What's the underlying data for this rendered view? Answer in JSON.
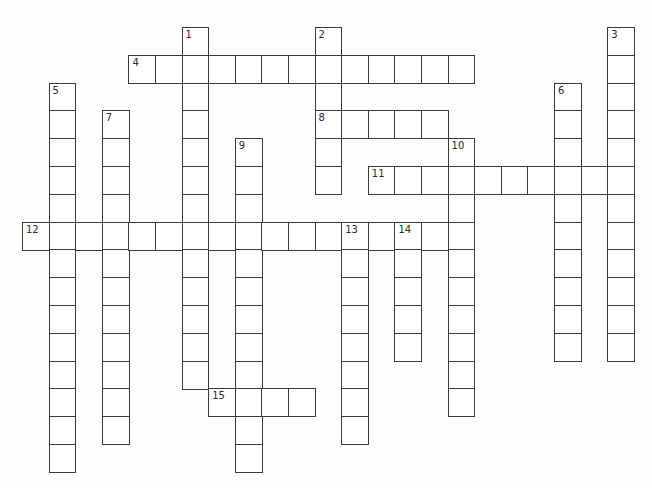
{
  "puzzle": {
    "layout": {
      "origin_x": 22,
      "origin_y": 27,
      "cell_w": 26.6,
      "cell_h": 27.8
    },
    "colors": {
      "border": "#3a3a3a",
      "cell_fill": "#ffffff",
      "background": "#fdfdfc"
    },
    "entries": [
      {
        "number": "1",
        "direction": "down",
        "row": 0,
        "col": 6,
        "length": 13
      },
      {
        "number": "2",
        "direction": "down",
        "row": 0,
        "col": 11,
        "length": 6
      },
      {
        "number": "3",
        "direction": "down",
        "row": 0,
        "col": 22,
        "length": 12
      },
      {
        "number": "4",
        "direction": "across",
        "row": 1,
        "col": 4,
        "length": 13
      },
      {
        "number": "5",
        "direction": "down",
        "row": 2,
        "col": 1,
        "length": 14
      },
      {
        "number": "6",
        "direction": "down",
        "row": 2,
        "col": 20,
        "length": 10
      },
      {
        "number": "7",
        "direction": "down",
        "row": 3,
        "col": 3,
        "length": 12
      },
      {
        "number": "8",
        "direction": "across",
        "row": 3,
        "col": 11,
        "length": 5
      },
      {
        "number": "9",
        "direction": "down",
        "row": 4,
        "col": 8,
        "length": 12
      },
      {
        "number": "10",
        "direction": "down",
        "row": 4,
        "col": 16,
        "length": 10
      },
      {
        "number": "11",
        "direction": "across",
        "row": 5,
        "col": 13,
        "length": 10
      },
      {
        "number": "12",
        "direction": "across",
        "row": 7,
        "col": 0,
        "length": 17
      },
      {
        "number": "13",
        "direction": "down",
        "row": 7,
        "col": 12,
        "length": 8
      },
      {
        "number": "14",
        "direction": "down",
        "row": 7,
        "col": 14,
        "length": 5
      },
      {
        "number": "15",
        "direction": "across",
        "row": 13,
        "col": 7,
        "length": 4
      }
    ]
  }
}
